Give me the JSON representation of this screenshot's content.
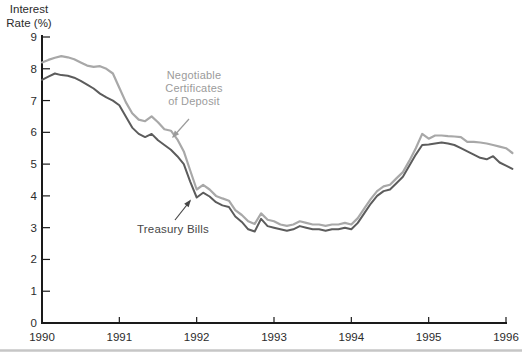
{
  "title": {
    "line1": "Interest",
    "line2": "Rate (%)"
  },
  "labels": {
    "cd_line1": "Negotiable",
    "cd_line2": "Certificates",
    "cd_line3": "of Deposit",
    "tbill": "Treasury Bills"
  },
  "colors": {
    "cd_line": "#a8a8a8",
    "tbill_line": "#5c5c5c",
    "cd_label_text": "#9b9b9b",
    "tbill_label_text": "#474747",
    "axis": "#1a1a1a",
    "tick_text": "#2b2b2b",
    "bottom_rule": "#c6c6c6"
  },
  "chart_data": {
    "type": "line",
    "title": "Interest Rate (%)",
    "ylabel": "Interest Rate (%)",
    "xlabel": "",
    "grid": false,
    "legend_position": "inline-annotations",
    "xlim": [
      1990,
      1996.17
    ],
    "ylim": [
      0,
      9
    ],
    "x_ticks": [
      1990,
      1991,
      1992,
      1993,
      1994,
      1995,
      1996
    ],
    "y_ticks": [
      0,
      1,
      2,
      3,
      4,
      5,
      6,
      7,
      8,
      9
    ],
    "x_sampling": "monthly, Jan 1990 through Feb 1996",
    "series": [
      {
        "name": "Negotiable Certificates of Deposit",
        "color": "#a8a8a8",
        "values": [
          8.2,
          8.28,
          8.35,
          8.4,
          8.36,
          8.3,
          8.2,
          8.1,
          8.06,
          8.08,
          8.0,
          7.85,
          7.4,
          6.95,
          6.6,
          6.4,
          6.35,
          6.5,
          6.32,
          6.1,
          6.05,
          5.78,
          5.4,
          4.8,
          4.2,
          4.35,
          4.2,
          4.0,
          3.92,
          3.85,
          3.55,
          3.4,
          3.2,
          3.12,
          3.45,
          3.25,
          3.2,
          3.1,
          3.06,
          3.1,
          3.2,
          3.15,
          3.1,
          3.1,
          3.06,
          3.1,
          3.1,
          3.15,
          3.1,
          3.3,
          3.6,
          3.9,
          4.15,
          4.3,
          4.35,
          4.55,
          4.75,
          5.1,
          5.5,
          5.95,
          5.8,
          5.9,
          5.9,
          5.88,
          5.87,
          5.85,
          5.7,
          5.7,
          5.68,
          5.65,
          5.6,
          5.55,
          5.5,
          5.35
        ]
      },
      {
        "name": "Treasury Bills",
        "color": "#5c5c5c",
        "values": [
          7.65,
          7.75,
          7.85,
          7.8,
          7.78,
          7.72,
          7.62,
          7.5,
          7.38,
          7.22,
          7.1,
          7.0,
          6.85,
          6.5,
          6.15,
          5.95,
          5.85,
          5.95,
          5.75,
          5.6,
          5.45,
          5.25,
          5.0,
          4.45,
          3.95,
          4.1,
          3.98,
          3.8,
          3.7,
          3.65,
          3.35,
          3.18,
          2.95,
          2.88,
          3.28,
          3.05,
          3.0,
          2.95,
          2.9,
          2.95,
          3.05,
          3.0,
          2.95,
          2.95,
          2.9,
          2.95,
          2.95,
          3.0,
          2.95,
          3.15,
          3.45,
          3.75,
          4.0,
          4.15,
          4.2,
          4.4,
          4.6,
          4.95,
          5.3,
          5.6,
          5.62,
          5.65,
          5.68,
          5.65,
          5.6,
          5.5,
          5.4,
          5.3,
          5.2,
          5.15,
          5.25,
          5.05,
          4.95,
          4.85
        ]
      }
    ]
  }
}
